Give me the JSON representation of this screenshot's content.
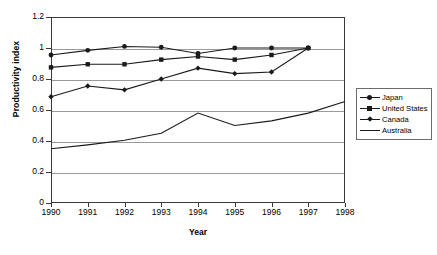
{
  "chart_data": {
    "type": "line",
    "title": "",
    "xlabel": "Year",
    "ylabel": "Productivity index",
    "x": [
      1990,
      1991,
      1992,
      1993,
      1994,
      1995,
      1996,
      1997,
      1998
    ],
    "xlim": [
      1990,
      1998
    ],
    "ylim": [
      0,
      1.2
    ],
    "ytick_labels": [
      "1.2",
      "1",
      "0.8",
      "0.6",
      "0.4",
      "0.2",
      "0"
    ],
    "ytick_values": [
      1.2,
      1.0,
      0.8,
      0.6,
      0.4,
      0.2,
      0
    ],
    "xtick_labels": [
      "1990",
      "1991",
      "1992",
      "1993",
      "1994",
      "1995",
      "1996",
      "1997",
      "1998"
    ],
    "grid": "horizontal",
    "legend_position": "right-middle",
    "series": [
      {
        "name": "Japan",
        "marker": "circle",
        "x": [
          1990,
          1991,
          1992,
          1993,
          1994,
          1995,
          1996,
          1997
        ],
        "values": [
          0.955,
          0.985,
          1.01,
          1.005,
          0.965,
          1.0,
          1.0,
          1.0
        ]
      },
      {
        "name": "United States",
        "marker": "square",
        "x": [
          1990,
          1991,
          1992,
          1993,
          1994,
          1995,
          1996,
          1997
        ],
        "values": [
          0.875,
          0.895,
          0.895,
          0.925,
          0.945,
          0.925,
          0.955,
          1.0
        ]
      },
      {
        "name": "Canada",
        "marker": "diamond",
        "x": [
          1990,
          1991,
          1992,
          1993,
          1994,
          1995,
          1996,
          1997
        ],
        "values": [
          0.685,
          0.755,
          0.73,
          0.8,
          0.87,
          0.835,
          0.845,
          1.0
        ]
      },
      {
        "name": "Australia",
        "marker": "none",
        "x": [
          1990,
          1991,
          1992,
          1993,
          1994,
          1995,
          1996,
          1997,
          1998
        ],
        "values": [
          0.35,
          0.375,
          0.405,
          0.45,
          0.58,
          0.5,
          0.53,
          0.58,
          0.655
        ]
      }
    ]
  },
  "legend": {
    "items": [
      {
        "label": "Japan",
        "marker": "circle"
      },
      {
        "label": "United States",
        "marker": "square"
      },
      {
        "label": "Canada",
        "marker": "diamond"
      },
      {
        "label": "Australia",
        "marker": "none"
      }
    ]
  },
  "colors": {
    "line": "#1a1a1a",
    "grid": "#9a9a9a",
    "frame": "#3a3a3a",
    "background": "#ffffff"
  }
}
